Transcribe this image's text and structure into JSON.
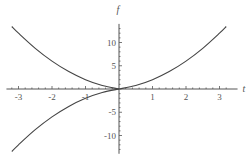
{
  "chart_data": {
    "type": "line",
    "title": "",
    "xlabel": "t",
    "ylabel": "f",
    "xlim": [
      -3.3,
      3.3
    ],
    "ylim": [
      -13.5,
      14
    ],
    "grid": false,
    "legend": "none",
    "xticks": [
      -3,
      -2,
      -1,
      1,
      2,
      3
    ],
    "xtick_labels": [
      "-3",
      "-2",
      "-1",
      "1",
      "2",
      "3"
    ],
    "yticks": [
      -10,
      -5,
      5,
      10
    ],
    "ytick_labels": [
      "-10",
      "-5",
      "5",
      "10"
    ],
    "series": [
      {
        "name": "upper-left branch",
        "x": [
          -3.2,
          -3.0,
          -2.5,
          -2.0,
          -1.5,
          -1.0,
          -0.5,
          0.0
        ],
        "y": [
          13.44,
          12.0,
          8.75,
          6.0,
          3.75,
          2.0,
          0.75,
          0.0
        ]
      },
      {
        "name": "lower-left branch",
        "x": [
          -3.2,
          -3.0,
          -2.5,
          -2.0,
          -1.5,
          -1.0,
          -0.5,
          0.0
        ],
        "y": [
          -13.44,
          -12.0,
          -8.75,
          -6.0,
          -3.75,
          -2.0,
          -0.75,
          0.0
        ]
      },
      {
        "name": "right branch",
        "x": [
          0.0,
          0.5,
          1.0,
          1.5,
          2.0,
          2.5,
          3.0,
          3.2
        ],
        "y": [
          0.0,
          0.75,
          2.0,
          3.75,
          6.0,
          8.75,
          12.0,
          13.44
        ]
      }
    ],
    "line_color": "#444444",
    "axis_color": "#555555"
  }
}
